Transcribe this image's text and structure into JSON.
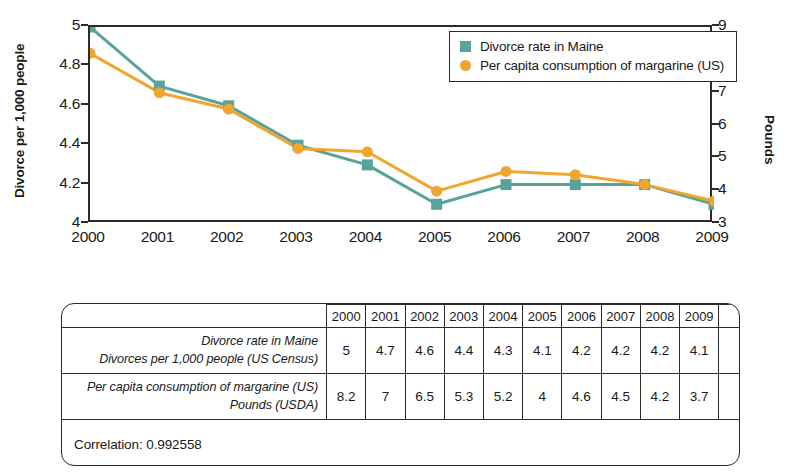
{
  "chart_data": {
    "type": "line",
    "title": "",
    "x": [
      "2000",
      "2001",
      "2002",
      "2003",
      "2004",
      "2005",
      "2006",
      "2007",
      "2008",
      "2009"
    ],
    "categories": [
      "2000",
      "2001",
      "2002",
      "2003",
      "2004",
      "2005",
      "2006",
      "2007",
      "2008",
      "2009"
    ],
    "series": [
      {
        "name": "Divorce rate in Maine",
        "axis": "left",
        "color": "#5aa39b",
        "marker": "square",
        "values": [
          5,
          4.7,
          4.6,
          4.4,
          4.3,
          4.1,
          4.2,
          4.2,
          4.2,
          4.1
        ]
      },
      {
        "name": "Per capita consumption of margarine (US)",
        "axis": "right",
        "color": "#f0a52e",
        "marker": "circle",
        "values": [
          8.2,
          7,
          6.5,
          5.3,
          5.2,
          4,
          4.6,
          4.5,
          4.2,
          3.7
        ]
      }
    ],
    "ylabel": "Divorce per 1,000 people",
    "ylim": [
      4,
      5
    ],
    "yticks": [
      "4",
      "4.2",
      "4.4",
      "4.6",
      "4.8",
      "5"
    ],
    "y2label": "Pounds",
    "y2lim": [
      3,
      9
    ],
    "y2ticks": [
      "3",
      "4",
      "5",
      "6",
      "7",
      "8",
      "9"
    ],
    "xlabel": "",
    "grid": false,
    "legend_position": "top-right"
  },
  "legend": {
    "items": [
      {
        "label": "Divorce rate in Maine",
        "marker": "square-marker-icon",
        "color": "#5aa39b"
      },
      {
        "label": "Per capita consumption of margarine (US)",
        "marker": "circle-marker-icon",
        "color": "#f0a52e"
      }
    ]
  },
  "table": {
    "year_headers": [
      "2000",
      "2001",
      "2002",
      "2003",
      "2004",
      "2005",
      "2006",
      "2007",
      "2008",
      "2009"
    ],
    "rows": [
      {
        "label_line1": "Divorce rate in Maine",
        "label_line2": "Divorces per 1,000 people (US Census)",
        "values": [
          "5",
          "4.7",
          "4.6",
          "4.4",
          "4.3",
          "4.1",
          "4.2",
          "4.2",
          "4.2",
          "4.1"
        ]
      },
      {
        "label_line1": "Per capita consumption of margarine (US)",
        "label_line2": "Pounds (USDA)",
        "values": [
          "8.2",
          "7",
          "6.5",
          "5.3",
          "5.2",
          "4",
          "4.6",
          "4.5",
          "4.2",
          "3.7"
        ]
      }
    ],
    "correlation_text": "Correlation: 0.992558"
  }
}
